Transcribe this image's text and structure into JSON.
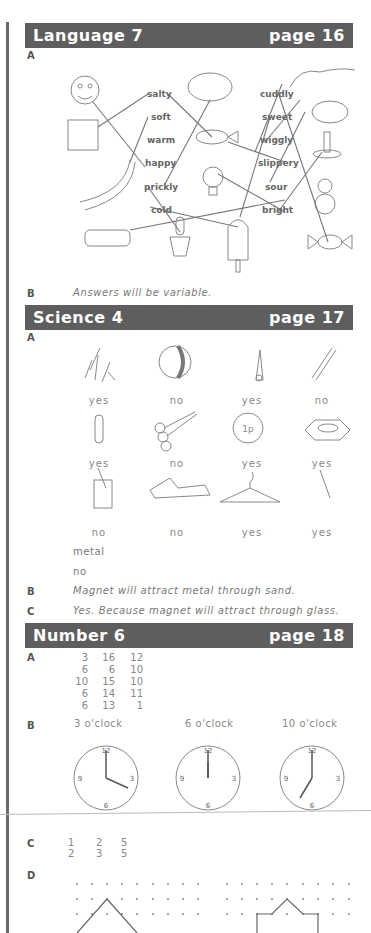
{
  "sections": {
    "language": {
      "title": "Language 7",
      "page": "page 16",
      "a_label": "A",
      "words_left": [
        "salty",
        "soft",
        "warm",
        "happy",
        "prickly",
        "cold"
      ],
      "words_right": [
        "cuddly",
        "sweet",
        "wiggly",
        "slippery",
        "sour",
        "bright"
      ],
      "b_label": "B",
      "b_answer": "Answers will be variable."
    },
    "science": {
      "title": "Science 4",
      "page": "page 17",
      "a_label": "A",
      "items": [
        {
          "object": "pins",
          "answer": "yes"
        },
        {
          "object": "ball",
          "answer": "no"
        },
        {
          "object": "safety-pin",
          "answer": "yes"
        },
        {
          "object": "pencil",
          "answer": "no"
        },
        {
          "object": "paperclip",
          "answer": "yes"
        },
        {
          "object": "spoons",
          "answer": "no"
        },
        {
          "object": "coin-1p",
          "answer": "yes"
        },
        {
          "object": "nut",
          "answer": "yes"
        },
        {
          "object": "glass",
          "answer": "no"
        },
        {
          "object": "book",
          "answer": "no"
        },
        {
          "object": "coat-hanger",
          "answer": "yes"
        },
        {
          "object": "needle",
          "answer": "yes"
        }
      ],
      "coin_text": "1p",
      "extra_1": "metal",
      "extra_2": "no",
      "b_label": "B",
      "b_answer": "Magnet will attract metal through sand.",
      "c_label": "C",
      "c_answer": "Yes. Because magnet will attract through glass."
    },
    "number": {
      "title": "Number 6",
      "page": "page 18",
      "a_label": "A",
      "a_rows": [
        [
          "3",
          "16",
          "12"
        ],
        [
          "6",
          "6",
          "10"
        ],
        [
          "10",
          "15",
          "10"
        ],
        [
          "6",
          "14",
          "11"
        ],
        [
          "6",
          "13",
          "1"
        ]
      ],
      "b_label": "B",
      "clocks": [
        {
          "label": "3 o'clock"
        },
        {
          "label": "6 o'clock"
        },
        {
          "label": "10 o'clock"
        }
      ],
      "c_label": "C",
      "c_rows": [
        [
          "1",
          "2",
          "5"
        ],
        [
          "2",
          "3",
          "5"
        ]
      ],
      "d_label": "D"
    }
  }
}
